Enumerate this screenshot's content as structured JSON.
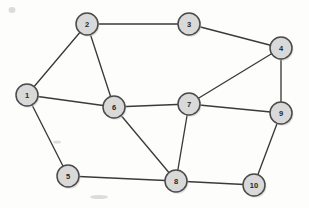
{
  "figure": {
    "kind": "undirected-graph-diagram",
    "width": 309,
    "height": 208,
    "background_color": "#fdfdfc"
  },
  "style": {
    "node_fill": "#d9d9d9",
    "node_stroke": "#4a4a4a",
    "node_radius": 11,
    "label_color": "#262626",
    "edge_color": "#3a3a3a",
    "edge_width": 1.35
  },
  "chart_data": {
    "type": "diagram",
    "title": "",
    "xlabel": "",
    "ylabel": "",
    "nodes": [
      {
        "id": "1",
        "label": "1",
        "x": 27,
        "y": 95
      },
      {
        "id": "2",
        "label": "2",
        "x": 87,
        "y": 24
      },
      {
        "id": "3",
        "label": "3",
        "x": 189,
        "y": 24
      },
      {
        "id": "4",
        "label": "4",
        "x": 281,
        "y": 48
      },
      {
        "id": "5",
        "label": "5",
        "x": 68,
        "y": 176
      },
      {
        "id": "6",
        "label": "6",
        "x": 114,
        "y": 107
      },
      {
        "id": "7",
        "label": "7",
        "x": 189,
        "y": 104
      },
      {
        "id": "8",
        "label": "8",
        "x": 176,
        "y": 181
      },
      {
        "id": "9",
        "label": "9",
        "x": 281,
        "y": 113
      },
      {
        "id": "10",
        "label": "10",
        "x": 254,
        "y": 185
      }
    ],
    "edges": [
      {
        "source": "1",
        "target": "2"
      },
      {
        "source": "1",
        "target": "6"
      },
      {
        "source": "1",
        "target": "5"
      },
      {
        "source": "2",
        "target": "3"
      },
      {
        "source": "2",
        "target": "6"
      },
      {
        "source": "3",
        "target": "4"
      },
      {
        "source": "4",
        "target": "7"
      },
      {
        "source": "4",
        "target": "9"
      },
      {
        "source": "5",
        "target": "8"
      },
      {
        "source": "6",
        "target": "7"
      },
      {
        "source": "6",
        "target": "8"
      },
      {
        "source": "7",
        "target": "8"
      },
      {
        "source": "7",
        "target": "9"
      },
      {
        "source": "8",
        "target": "10"
      },
      {
        "source": "9",
        "target": "10"
      }
    ]
  }
}
